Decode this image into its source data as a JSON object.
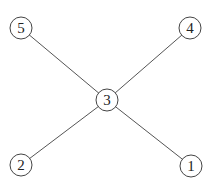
{
  "graph": {
    "type": "tree",
    "nodes": [
      {
        "id": "1",
        "label": "1",
        "x": 191,
        "y": 166
      },
      {
        "id": "2",
        "label": "2",
        "x": 21,
        "y": 165
      },
      {
        "id": "3",
        "label": "3",
        "x": 107,
        "y": 100
      },
      {
        "id": "4",
        "label": "4",
        "x": 190,
        "y": 28
      },
      {
        "id": "5",
        "label": "5",
        "x": 21,
        "y": 28
      }
    ],
    "edges": [
      {
        "from": "3",
        "to": "5"
      },
      {
        "from": "3",
        "to": "4"
      },
      {
        "from": "3",
        "to": "2"
      },
      {
        "from": "3",
        "to": "1"
      }
    ],
    "node_radius": 11,
    "colors": {
      "stroke": "#444444",
      "edge": "#555555",
      "background": "#ffffff"
    }
  }
}
